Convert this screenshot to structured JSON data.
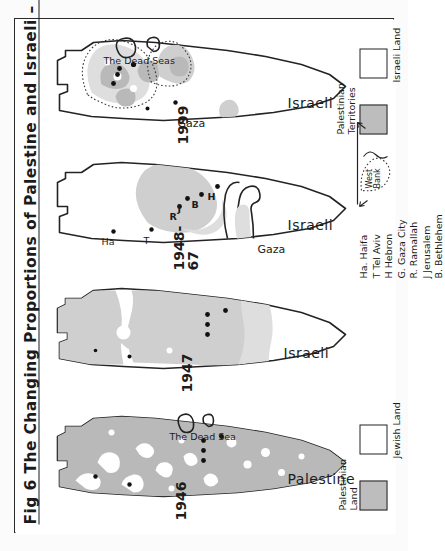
{
  "figure": {
    "title_prefix": "Fig 6",
    "title_main": "The Changing Proportions of Palestine and Israeli",
    "title_range": "– 1946 - 1999",
    "full_title": "Fig 6  The Changing Proportions of Palestine and Israeli – 1946 - 1999"
  },
  "panels": [
    {
      "id": "panel-1946",
      "year": "1946",
      "country_label": "Palestine",
      "dead_sea_label": "The Dead Sea",
      "has_gaza_label": false,
      "gaza_label": ""
    },
    {
      "id": "panel-1947",
      "year": "1947",
      "country_label": "Israeli",
      "dead_sea_label": "",
      "has_gaza_label": false,
      "gaza_label": ""
    },
    {
      "id": "panel-1948-67",
      "year": "1948-\n67",
      "country_label": "Israeli",
      "dead_sea_label": "",
      "has_gaza_label": true,
      "gaza_label": "Gaza"
    },
    {
      "id": "panel-1999",
      "year": "1999",
      "country_label": "Israeli",
      "dead_sea_label": "The Dead Seas",
      "has_gaza_label": true,
      "gaza_label": "Gaza"
    }
  ],
  "city_markers": {
    "1948_67": [
      "R",
      "J",
      "B",
      "H",
      "Ha",
      "T"
    ],
    "1999": []
  },
  "legend_bottom": {
    "name": "legend-1946",
    "items": [
      {
        "label": "Palestinian\nLand",
        "swatch": "shaded",
        "color": "#bdbdbd"
      },
      {
        "label": "Jewish Land",
        "swatch": "empty",
        "color": "#ffffff"
      }
    ]
  },
  "legend_top": {
    "name": "legend-1999",
    "items": [
      {
        "label": "Palestinian\nTerritories",
        "swatch": "shaded",
        "color": "#bdbdbd"
      },
      {
        "label": "Israeli Land",
        "swatch": "empty",
        "color": "#ffffff"
      }
    ]
  },
  "city_key": {
    "title": "",
    "entries": [
      "Ha. Haifa",
      "T  Tel Aviv",
      "H  Hebron",
      "G. Gaza City",
      "R. Ramallah",
      "J  Jerusalem",
      "B. Bethlehem"
    ]
  },
  "west_bank_inset": {
    "label": "West\nBank"
  },
  "colors": {
    "ink": "#232323",
    "shade_dark": "#b9b9b9",
    "shade_mid": "#cfcfcf",
    "shade_light": "#dedede",
    "paper": "#ffffff"
  }
}
